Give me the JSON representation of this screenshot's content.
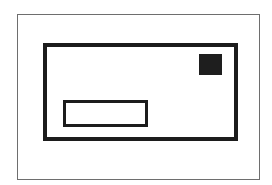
{
  "figure": {
    "type": "envelope-icon",
    "colors": {
      "background": "#ffffff",
      "frame": "#6e6e6e",
      "stroke": "#1c1c1c",
      "stamp": "#1e1e1e"
    },
    "parts": [
      "frame",
      "envelope",
      "stamp",
      "address-window"
    ]
  }
}
